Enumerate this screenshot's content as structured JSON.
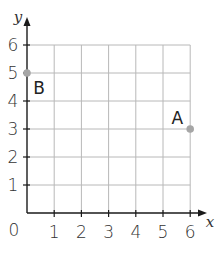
{
  "chart_data": {
    "type": "scatter",
    "title": "",
    "xlabel": "x",
    "ylabel": "y",
    "xlim": [
      0,
      6
    ],
    "ylim": [
      0,
      6
    ],
    "grid": true,
    "x_ticks": [
      "1",
      "2",
      "3",
      "4",
      "5",
      "6"
    ],
    "y_ticks": [
      "1",
      "2",
      "3",
      "4",
      "5",
      "6"
    ],
    "origin_label": "0",
    "points": [
      {
        "label": "A",
        "x": 6,
        "y": 3
      },
      {
        "label": "B",
        "x": 0,
        "y": 5
      }
    ]
  },
  "colors": {
    "axis": "#1a1a1a",
    "grid": "#b8b8b8",
    "point": "#a6a6a6",
    "text": "#333333"
  }
}
